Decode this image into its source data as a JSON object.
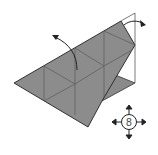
{
  "diagram": {
    "type": "origami-fold-step",
    "colors": {
      "paper": "#8c8c8c",
      "paper_dark": "#7a7a7a",
      "crease": "#555555",
      "edge": "#222222",
      "background": "#ffffff"
    },
    "step_indicator": {
      "number": "8",
      "arrows": [
        "up",
        "down",
        "left",
        "right"
      ]
    },
    "arrows": [
      {
        "name": "fold-arrow-left",
        "direction": "up-left"
      },
      {
        "name": "fold-arrow-right",
        "direction": "right"
      }
    ]
  }
}
